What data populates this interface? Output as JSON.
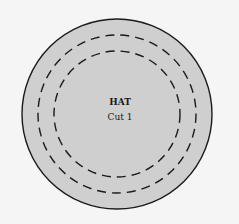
{
  "diagram": {
    "title": "HAT",
    "subtitle": "Cut 1",
    "colors": {
      "background": "#f5f5f5",
      "fill": "#cfcfcf",
      "stroke": "#1a1a1a"
    },
    "shapes": [
      {
        "type": "circle",
        "style": "solid",
        "role": "outer-edge"
      },
      {
        "type": "circle",
        "style": "dashed",
        "role": "outer-cut-line"
      },
      {
        "type": "circle",
        "style": "dashed",
        "role": "inner-cut-line"
      }
    ]
  }
}
